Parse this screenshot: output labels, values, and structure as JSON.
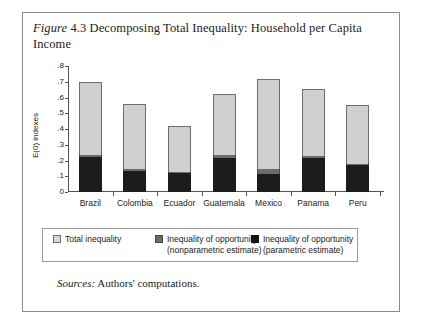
{
  "figure": {
    "label": "Figure",
    "number": "4.3",
    "title": "Decomposing Total Inequality: Household per Capita Income",
    "title_full": "Figure 4.3 Decomposing Total Inequality: Household per Capita Income"
  },
  "source": {
    "label": "Sources:",
    "text": "Authors' computations."
  },
  "legend": {
    "items": [
      {
        "label": "Total inequality",
        "label_line2": "",
        "color": "#d8d8d8",
        "swatch": "total-inequality-swatch"
      },
      {
        "label": "Inequality of opportunity",
        "label_line2": "(nonparametric estimate)",
        "color": "#6b6b6b",
        "swatch": "nonparametric-swatch"
      },
      {
        "label": "Inequality of opportunity",
        "label_line2": "(parametric estimate)",
        "color": "#141414",
        "swatch": "parametric-swatch"
      }
    ]
  },
  "chart_data": {
    "type": "bar",
    "stacked": true,
    "title": "Decomposing Total Inequality: Household per Capita Income",
    "xlabel": "",
    "ylabel": "E(0) indexes",
    "ylim": [
      0,
      0.8
    ],
    "yticks": [
      "0",
      ".1",
      ".2",
      ".3",
      ".4",
      ".5",
      ".6",
      ".7",
      ".8"
    ],
    "ytick_values": [
      0,
      0.1,
      0.2,
      0.3,
      0.4,
      0.5,
      0.6,
      0.7,
      0.8
    ],
    "grid": false,
    "legend_position": "bottom",
    "categories": [
      "Brazil",
      "Colombia",
      "Ecuador",
      "Guatemala",
      "Mexico",
      "Panama",
      "Peru"
    ],
    "series": [
      {
        "name": "Total inequality",
        "color": "#d0d0d0",
        "values": [
          0.7,
          0.56,
          0.42,
          0.625,
          0.715,
          0.655,
          0.555
        ]
      },
      {
        "name": "Inequality of opportunity (nonparametric estimate)",
        "color": "#6b6b6b",
        "values": [
          0.235,
          0.145,
          0.125,
          0.235,
          0.145,
          0.23,
          0.175
        ]
      },
      {
        "name": "Inequality of opportunity (parametric estimate)",
        "color": "#1c1c1c",
        "values": [
          0.225,
          0.135,
          0.118,
          0.215,
          0.115,
          0.215,
          0.17
        ]
      }
    ]
  }
}
